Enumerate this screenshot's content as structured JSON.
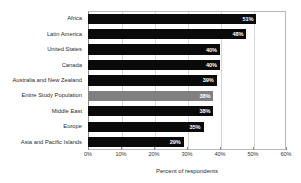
{
  "chart_data": {
    "type": "bar",
    "orientation": "horizontal",
    "title": "",
    "xlabel": "Percent of respondents",
    "ylabel": "",
    "xlim": [
      0,
      60
    ],
    "grid": true,
    "legend": null,
    "xticks": [
      "0%",
      "10%",
      "20%",
      "30%",
      "40%",
      "50%",
      "60%"
    ],
    "xtick_values": [
      0,
      10,
      20,
      30,
      40,
      50,
      60
    ],
    "categories": [
      "Africa",
      "Latin America",
      "United States",
      "Canada",
      "Australia and New Zealand",
      "Entire Study Population",
      "Middle East",
      "Europe",
      "Asia and Pacific Islands"
    ],
    "values": [
      51,
      48,
      40,
      40,
      39,
      38,
      38,
      35,
      29
    ],
    "data_labels": [
      "51%",
      "48%",
      "40%",
      "40%",
      "39%",
      "38%",
      "38%",
      "35%",
      "29%"
    ],
    "highlight_index": 5,
    "colors": {
      "bar": "#0a0a0a",
      "highlight_bar": "#808080",
      "data_label_text": "#ffffff",
      "grid": "#d6d6d6",
      "axis": "#8a8a8a",
      "background": "#ffffff"
    }
  }
}
